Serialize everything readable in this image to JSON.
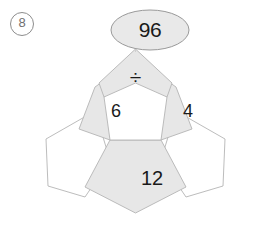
{
  "problem": {
    "number_label": "8",
    "number_display": "Ⓑ"
  },
  "figure": {
    "type": "pentagon-net-puzzle",
    "result_bubble": {
      "shape": "ellipse",
      "value": "96",
      "fill": "#e9e9e9",
      "stroke": "#9a9a9a"
    },
    "colors": {
      "filled_cell": "#e7e7e7",
      "empty_cell": "#ffffff",
      "outline": "#b4b4b4",
      "text": "#1a1a1a",
      "problem_number": "#6f6f6f"
    },
    "cells": [
      {
        "name": "top-operator-pentagon",
        "position": "top",
        "value": "÷",
        "filled": true
      },
      {
        "name": "upper-left-pentagon",
        "position": "upper-left",
        "value": "6",
        "filled": true
      },
      {
        "name": "upper-right-pentagon",
        "position": "upper-right",
        "value": "4",
        "filled": true
      },
      {
        "name": "bottom-pentagon",
        "position": "bottom",
        "value": "12",
        "filled": true
      },
      {
        "name": "center-pentagon",
        "position": "center",
        "value": "",
        "filled": false
      },
      {
        "name": "lower-left-pentagon",
        "position": "lower-left",
        "value": "",
        "filled": false
      },
      {
        "name": "lower-right-pentagon",
        "position": "lower-right",
        "value": "",
        "filled": false
      }
    ]
  }
}
